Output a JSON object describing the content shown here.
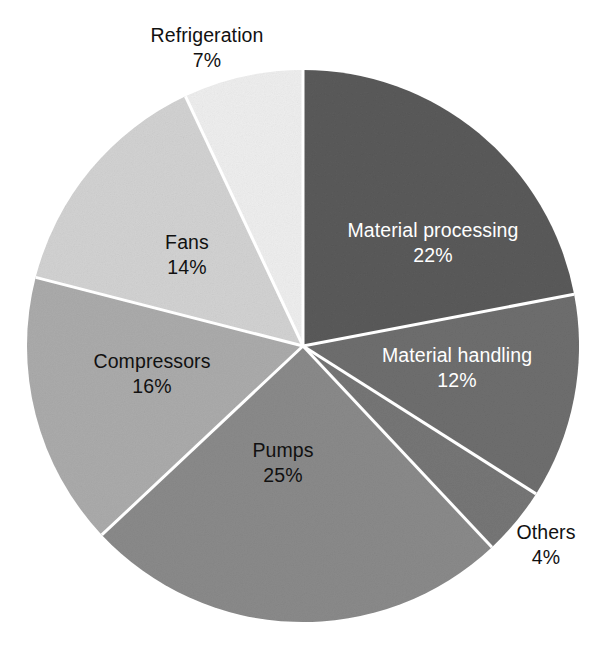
{
  "chart_data": {
    "type": "pie",
    "title": "",
    "subtitle": "",
    "xlabel": "",
    "ylabel": "",
    "legend": "none",
    "grid": false,
    "units": "percent",
    "total": 100,
    "start_angle_deg": 0,
    "direction": "clockwise",
    "categories": [
      "Material processing",
      "Material handling",
      "Others",
      "Pumps",
      "Compressors",
      "Fans",
      "Refrigeration"
    ],
    "values": [
      22,
      12,
      4,
      25,
      16,
      14,
      7
    ],
    "slices": [
      {
        "name": "Material processing",
        "value": 22,
        "pct_label": "22%",
        "color": "#5a5a5a",
        "label_color": "#ffffff",
        "label_placement": "inside",
        "label_x": 433,
        "label_y": 243
      },
      {
        "name": "Material handling",
        "value": 12,
        "pct_label": "12%",
        "color": "#6e6e6e",
        "label_color": "#ffffff",
        "label_placement": "inside",
        "label_x": 457,
        "label_y": 368
      },
      {
        "name": "Others",
        "value": 4,
        "pct_label": "4%",
        "color": "#767676",
        "label_color": "#111111",
        "label_placement": "outside",
        "label_x": 546,
        "label_y": 545
      },
      {
        "name": "Pumps",
        "value": 25,
        "pct_label": "25%",
        "color": "#8a8a8a",
        "label_color": "#111111",
        "label_placement": "inside",
        "label_x": 283,
        "label_y": 463
      },
      {
        "name": "Compressors",
        "value": 16,
        "pct_label": "16%",
        "color": "#ababab",
        "label_color": "#111111",
        "label_placement": "inside",
        "label_x": 152,
        "label_y": 374
      },
      {
        "name": "Fans",
        "value": 14,
        "pct_label": "14%",
        "color": "#d2d2d2",
        "label_color": "#111111",
        "label_placement": "inside",
        "label_x": 187,
        "label_y": 255
      },
      {
        "name": "Refrigeration",
        "value": 7,
        "pct_label": "7%",
        "color": "#eeeeee",
        "label_color": "#111111",
        "label_placement": "outside",
        "label_x": 207,
        "label_y": 48
      }
    ],
    "geometry": {
      "center_x": 303,
      "center_y": 346,
      "radius": 276,
      "separator_color": "#ffffff",
      "separator_width": 3
    },
    "background_color": "#ffffff"
  }
}
